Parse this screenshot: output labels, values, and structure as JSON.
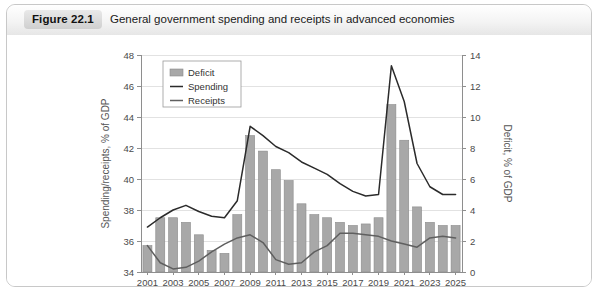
{
  "figure": {
    "badge": "Figure 22.1",
    "title": "General government spending and receipts in advanced economies"
  },
  "legend": {
    "position": "top-left-inside",
    "items": [
      {
        "label": "Deficit",
        "marker": "bar-swatch",
        "color": "#a8a8a8"
      },
      {
        "label": "Spending",
        "marker": "line",
        "color": "#2b2b2b"
      },
      {
        "label": "Receipts",
        "marker": "line",
        "color": "#5f5f5f"
      }
    ]
  },
  "axes": {
    "left_title": "Spending/receipts, % of GDP",
    "right_title": "Deficit, % of GDP",
    "left_ticks": [
      "34",
      "36",
      "38",
      "40",
      "42",
      "44",
      "46",
      "48"
    ],
    "right_ticks": [
      "0",
      "2",
      "4",
      "6",
      "8",
      "10",
      "12",
      "14"
    ],
    "x_ticks": [
      "2001",
      "2003",
      "2005",
      "2007",
      "2009",
      "2011",
      "2013",
      "2015",
      "2017",
      "2019",
      "2021",
      "2023",
      "2025"
    ]
  },
  "chart_data": {
    "type": "bar",
    "title": "General government spending and receipts in advanced economies",
    "xlabel": "",
    "ylabel": "Spending/receipts, % of GDP",
    "y2label": "Deficit, % of GDP",
    "ylim": [
      34,
      48
    ],
    "y2lim": [
      0,
      14
    ],
    "grid": true,
    "legend_position": "upper left",
    "categories": [
      "2001",
      "2002",
      "2003",
      "2004",
      "2005",
      "2006",
      "2007",
      "2008",
      "2009",
      "2010",
      "2011",
      "2012",
      "2013",
      "2014",
      "2015",
      "2016",
      "2017",
      "2018",
      "2019",
      "2020",
      "2021",
      "2022",
      "2023",
      "2024",
      "2025"
    ],
    "series": [
      {
        "name": "Deficit",
        "type": "bar",
        "axis": "right",
        "unit": "% of GDP",
        "values": [
          1.7,
          3.5,
          3.5,
          3.2,
          2.4,
          1.4,
          1.2,
          3.7,
          8.8,
          7.8,
          6.6,
          5.9,
          4.4,
          3.7,
          3.5,
          3.2,
          3.0,
          3.1,
          3.5,
          10.8,
          8.5,
          4.2,
          3.2,
          3.0,
          3.0
        ]
      },
      {
        "name": "Spending",
        "type": "line",
        "axis": "left",
        "unit": "% of GDP",
        "values": [
          36.9,
          37.5,
          38.0,
          38.3,
          37.9,
          37.6,
          37.5,
          38.6,
          43.4,
          42.8,
          42.1,
          41.7,
          41.1,
          40.7,
          40.3,
          39.7,
          39.2,
          38.9,
          39.0,
          47.3,
          45.0,
          41.0,
          39.5,
          39.0,
          39.0
        ]
      },
      {
        "name": "Receipts",
        "type": "line",
        "axis": "left",
        "unit": "% of GDP",
        "values": [
          35.7,
          34.6,
          34.2,
          34.3,
          34.7,
          35.3,
          35.8,
          36.2,
          36.4,
          35.9,
          34.8,
          34.5,
          34.6,
          35.3,
          35.7,
          36.5,
          36.5,
          36.4,
          36.3,
          36.0,
          35.8,
          35.6,
          36.2,
          36.3,
          36.2
        ]
      }
    ]
  }
}
